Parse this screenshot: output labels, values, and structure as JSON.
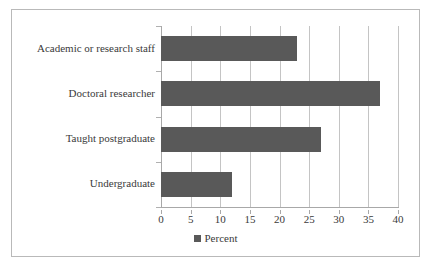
{
  "chart_data": {
    "type": "bar",
    "orientation": "horizontal",
    "title": "",
    "xlabel": "",
    "ylabel": "",
    "categories": [
      "Academic or research staff",
      "Doctoral researcher",
      "Taught postgraduate",
      "Undergraduate"
    ],
    "series": [
      {
        "name": "Percent",
        "values": [
          23,
          37,
          27,
          12
        ]
      }
    ],
    "xlim": [
      0,
      40
    ],
    "xticks": [
      0,
      5,
      10,
      15,
      20,
      25,
      30,
      35,
      40
    ],
    "xtick_labels": [
      "0",
      "5",
      "10",
      "15",
      "20",
      "25",
      "30",
      "35",
      "40"
    ],
    "grid": true,
    "grid_axis": "x",
    "legend": {
      "position": "bottom",
      "entries": [
        {
          "label": "Percent",
          "color": "#595959",
          "marker": "square"
        }
      ]
    },
    "colors": {
      "bar": "#595959",
      "gridline": "#c4c4c4",
      "axis": "#a8a8a8",
      "frame": "#b9b9b9",
      "text": "#3a3a3a",
      "background": "#ffffff"
    }
  }
}
